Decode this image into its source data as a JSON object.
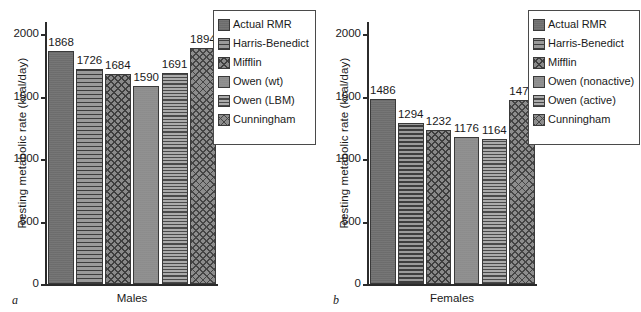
{
  "figure": {
    "panels": [
      {
        "letter": "a",
        "ylabel": "Resting metabolic rate (kcal/day)",
        "xlabel": "Males",
        "yticks": [
          "0",
          "500",
          "1000",
          "1500",
          "2000"
        ],
        "legend_title": "",
        "series": [
          {
            "label": "Actual RMR",
            "value": 1868,
            "value_text": "1868",
            "pattern": "pat-solid-dark"
          },
          {
            "label": "Harris-Benedict",
            "value": 1726,
            "value_text": "1726",
            "pattern": "pat-hlines-dark"
          },
          {
            "label": "Mifflin",
            "value": 1684,
            "value_text": "1684",
            "pattern": "pat-cross-dark"
          },
          {
            "label": "Owen (wt)",
            "value": 1590,
            "value_text": "1590",
            "pattern": "pat-solid-light"
          },
          {
            "label": "Owen (LBM)",
            "value": 1691,
            "value_text": "1691",
            "pattern": "pat-hlines-light"
          },
          {
            "label": "Cunningham",
            "value": 1894,
            "value_text": "1894",
            "pattern": "pat-cross-light"
          }
        ]
      },
      {
        "letter": "b",
        "ylabel": "Resting metabolic rate (kcal/day)",
        "xlabel": "Females",
        "yticks": [
          "0",
          "500",
          "1000",
          "1500",
          "2000"
        ],
        "legend_title": "",
        "series": [
          {
            "label": "Actual RMR",
            "value": 1486,
            "value_text": "1486",
            "pattern": "pat-solid-dark"
          },
          {
            "label": "Harris-Benedict",
            "value": 1294,
            "value_text": "1294",
            "pattern": "pat-hlines-dark"
          },
          {
            "label": "Mifflin",
            "value": 1232,
            "value_text": "1232",
            "pattern": "pat-cross-dark"
          },
          {
            "label": "Owen (nonactive)",
            "value": 1176,
            "value_text": "1176",
            "pattern": "pat-solid-light"
          },
          {
            "label": "Owen (active)",
            "value": 1164,
            "value_text": "1164",
            "pattern": "pat-hlines-light"
          },
          {
            "label": "Cunningham",
            "value": 1477,
            "value_text": "1477",
            "pattern": "pat-cross-light"
          }
        ]
      }
    ]
  },
  "colors": {
    "axis": "#2b2b2b",
    "text": "#1a1a1a",
    "legend_border": "#4a4a4a",
    "background": "#ffffff"
  },
  "chart_data": [
    {
      "type": "bar",
      "title": "a  Males",
      "panel": "a",
      "xlabel": "Males",
      "ylabel": "Resting metabolic rate (kcal/day)",
      "ylim": [
        0,
        2100
      ],
      "yticks": [
        0,
        500,
        1000,
        1500,
        2000
      ],
      "grid": false,
      "legend_position": "top-right",
      "categories": [
        "Actual RMR",
        "Harris-Benedict",
        "Mifflin",
        "Owen (wt)",
        "Owen (LBM)",
        "Cunningham"
      ],
      "values": [
        1868,
        1726,
        1684,
        1590,
        1691,
        1894
      ],
      "data_labels": [
        "1868",
        "1726",
        "1684",
        "1590",
        "1691",
        "1894"
      ]
    },
    {
      "type": "bar",
      "title": "b  Females",
      "panel": "b",
      "xlabel": "Females",
      "ylabel": "Resting metabolic rate (kcal/day)",
      "ylim": [
        0,
        2100
      ],
      "yticks": [
        0,
        500,
        1000,
        1500,
        2000
      ],
      "grid": false,
      "legend_position": "top-right",
      "categories": [
        "Actual RMR",
        "Harris-Benedict",
        "Mifflin",
        "Owen (nonactive)",
        "Owen (active)",
        "Cunningham"
      ],
      "values": [
        1486,
        1294,
        1232,
        1176,
        1164,
        1477
      ],
      "data_labels": [
        "1486",
        "1294",
        "1232",
        "1176",
        "1164",
        "1477"
      ]
    }
  ]
}
